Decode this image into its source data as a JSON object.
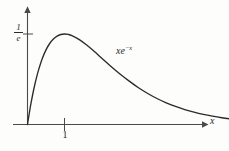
{
  "figure": {
    "background_color": "#fdfdfc",
    "stroke_color": "#2b2b2b",
    "axis_color": "#4a4a4a",
    "width": 229,
    "height": 151
  },
  "labels": {
    "y_axis_value_numerator": "1",
    "y_axis_value_denominator": "e",
    "x_tick_one": "1",
    "x_axis_name": "x",
    "curve_base": "xe",
    "curve_exponent": "−x"
  },
  "chart_data": {
    "type": "line",
    "title": "",
    "subtitle": "",
    "xlabel": "x",
    "ylabel": "",
    "function": "xe^{-x}",
    "annotations": [
      {
        "text": "xe^{-x}",
        "x": 2.85,
        "y": 0.26
      },
      {
        "text": "1/e",
        "x": 0.0,
        "y": 0.3679
      },
      {
        "text": "1",
        "x": 1.0,
        "y": 0.0
      }
    ],
    "legend": [],
    "legend_position": "none",
    "grid": false,
    "xlim": [
      -0.45,
      6.1
    ],
    "ylim": [
      -0.06,
      0.52
    ],
    "xticks": [
      1
    ],
    "xtick_labels": [
      "1"
    ],
    "yticks": [
      0.3679
    ],
    "ytick_labels": [
      "1/e"
    ],
    "maximum": {
      "x": 1,
      "y": 0.3679
    },
    "series": [
      {
        "name": "xe^{-x}",
        "color": "#2b2b2b",
        "x": [
          0.0,
          0.05,
          0.1,
          0.15,
          0.2,
          0.25,
          0.3,
          0.4,
          0.5,
          0.6,
          0.7,
          0.8,
          0.9,
          1.0,
          1.1,
          1.2,
          1.4,
          1.6,
          1.8,
          2.0,
          2.25,
          2.5,
          2.75,
          3.0,
          3.25,
          3.5,
          3.75,
          4.0,
          4.25,
          4.5,
          4.75,
          5.0,
          5.25,
          5.5,
          5.75
        ],
        "y": [
          0.0,
          0.0476,
          0.0905,
          0.1291,
          0.1637,
          0.1947,
          0.2222,
          0.2681,
          0.3033,
          0.3293,
          0.3476,
          0.3595,
          0.3659,
          0.3679,
          0.3662,
          0.3614,
          0.3452,
          0.323,
          0.2975,
          0.2707,
          0.2369,
          0.2052,
          0.1762,
          0.1494,
          0.1262,
          0.1057,
          0.0881,
          0.0733,
          0.0607,
          0.05,
          0.041,
          0.0337,
          0.0275,
          0.0224,
          0.0182
        ]
      }
    ]
  }
}
